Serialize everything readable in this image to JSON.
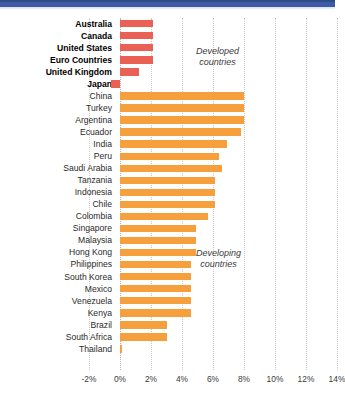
{
  "chart_data": {
    "type": "bar",
    "orientation": "horizontal",
    "title": "",
    "subtitle": "",
    "xlabel": "",
    "ylabel": "",
    "xlim": [
      -2,
      14
    ],
    "xticks": [
      "-2%",
      "0%",
      "2%",
      "4%",
      "6%",
      "8%",
      "10%",
      "12%",
      "14%"
    ],
    "xtick_values": [
      -2,
      0,
      2,
      4,
      6,
      8,
      10,
      12,
      14
    ],
    "grid": true,
    "legend": "none",
    "annotations": [
      {
        "text_line1": "Developed",
        "text_line2": "countries"
      },
      {
        "text_line1": "Developing",
        "text_line2": "countries"
      }
    ],
    "groups": [
      {
        "name": "Developed countries",
        "color": "#ea6055",
        "categories": [
          "Australia",
          "Canada",
          "United States",
          "Euro Countries",
          "United Kingdom",
          "Japan"
        ],
        "values": [
          2.1,
          2.1,
          2.1,
          2.1,
          1.2,
          -0.6
        ]
      },
      {
        "name": "Developing countries",
        "color": "#f5a03c",
        "categories": [
          "China",
          "Turkey",
          "Argentina",
          "Ecuador",
          "India",
          "Peru",
          "Saudi Arabia",
          "Tanzania",
          "Indonesia",
          "Chile",
          "Colombia",
          "Singapore",
          "Malaysia",
          "Hong Kong",
          "Philippines",
          "South Korea",
          "Mexico",
          "Venezuela",
          "Kenya",
          "Brazil",
          "South Africa",
          "Thailand"
        ],
        "values": [
          8.0,
          8.0,
          8.0,
          7.8,
          6.9,
          6.4,
          6.6,
          6.1,
          6.1,
          6.1,
          5.7,
          4.9,
          4.9,
          4.9,
          4.6,
          4.6,
          4.6,
          4.6,
          4.6,
          3.0,
          3.0,
          0.1
        ]
      }
    ]
  },
  "bars": [
    {
      "label": "Australia",
      "value": 2.1,
      "group": "developed"
    },
    {
      "label": "Canada",
      "value": 2.1,
      "group": "developed"
    },
    {
      "label": "United States",
      "value": 2.1,
      "group": "developed"
    },
    {
      "label": "Euro Countries",
      "value": 2.1,
      "group": "developed"
    },
    {
      "label": "United Kingdom",
      "value": 1.2,
      "group": "developed"
    },
    {
      "label": "Japan",
      "value": -0.6,
      "group": "developed"
    },
    {
      "label": "China",
      "value": 8.0,
      "group": "developing"
    },
    {
      "label": "Turkey",
      "value": 8.0,
      "group": "developing"
    },
    {
      "label": "Argentina",
      "value": 8.0,
      "group": "developing"
    },
    {
      "label": "Ecuador",
      "value": 7.8,
      "group": "developing"
    },
    {
      "label": "India",
      "value": 6.9,
      "group": "developing"
    },
    {
      "label": "Peru",
      "value": 6.4,
      "group": "developing"
    },
    {
      "label": "Saudi Arabia",
      "value": 6.6,
      "group": "developing"
    },
    {
      "label": "Tanzania",
      "value": 6.1,
      "group": "developing"
    },
    {
      "label": "Indonesia",
      "value": 6.1,
      "group": "developing"
    },
    {
      "label": "Chile",
      "value": 6.1,
      "group": "developing"
    },
    {
      "label": "Colombia",
      "value": 5.7,
      "group": "developing"
    },
    {
      "label": "Singapore",
      "value": 4.9,
      "group": "developing"
    },
    {
      "label": "Malaysia",
      "value": 4.9,
      "group": "developing"
    },
    {
      "label": "Hong Kong",
      "value": 4.9,
      "group": "developing"
    },
    {
      "label": "Philippines",
      "value": 4.6,
      "group": "developing"
    },
    {
      "label": "South Korea",
      "value": 4.6,
      "group": "developing"
    },
    {
      "label": "Mexico",
      "value": 4.6,
      "group": "developing"
    },
    {
      "label": "Venezuela",
      "value": 4.6,
      "group": "developing"
    },
    {
      "label": "Kenya",
      "value": 4.6,
      "group": "developing"
    },
    {
      "label": "Brazil",
      "value": 3.0,
      "group": "developing"
    },
    {
      "label": "South Africa",
      "value": 3.0,
      "group": "developing"
    },
    {
      "label": "Thailand",
      "value": 0.1,
      "group": "developing"
    }
  ],
  "annotations": {
    "developed": {
      "line1": "Developed",
      "line2": "countries"
    },
    "developing": {
      "line1": "Developing",
      "line2": "countries"
    }
  },
  "colors": {
    "developed_bar": "#ea6055",
    "developing_bar": "#f5a03c",
    "header_strip": "#3b5ba5",
    "gridline": "#c9c9c9",
    "text": "#2b2b2b"
  }
}
